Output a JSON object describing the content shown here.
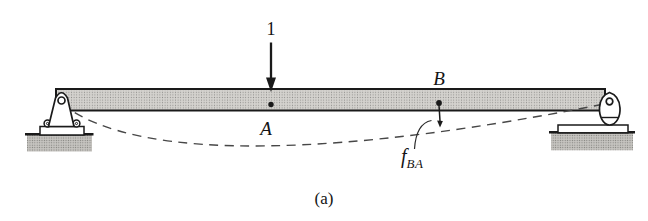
{
  "figure": {
    "caption": "(a)",
    "load_label": "1",
    "point_a_label": "A",
    "point_b_label": "B",
    "deflection_label": {
      "symbol": "f",
      "subscript": "BA"
    }
  },
  "colors": {
    "background": "#ffffff",
    "line": "#1a1a1a",
    "dashed_curve": "#474747",
    "beam_fill": "#d4d2ce",
    "beam_dot": "#8f8e8b",
    "ground_fill": "#c6c4c0",
    "ground_dot": "#7d7c79",
    "support_fill": "#ffffff"
  }
}
